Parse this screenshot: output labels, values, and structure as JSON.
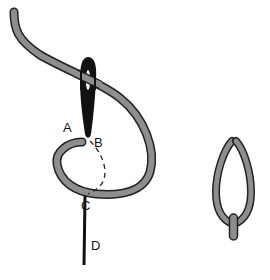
{
  "diagram": {
    "labels": {
      "a": "A",
      "b": "B",
      "c": "C",
      "d": "D"
    },
    "colors": {
      "thread_fill": "#8e8e8e",
      "thread_outline": "#222222",
      "needle": "#111111",
      "background": "#ffffff"
    },
    "figures": [
      {
        "name": "working-stitch",
        "description": "Needle through fabric at B, thread looped around and emerging at C"
      },
      {
        "name": "finished-stitch",
        "description": "Completed detached chain stitch with tacking stitch at bottom"
      }
    ]
  }
}
